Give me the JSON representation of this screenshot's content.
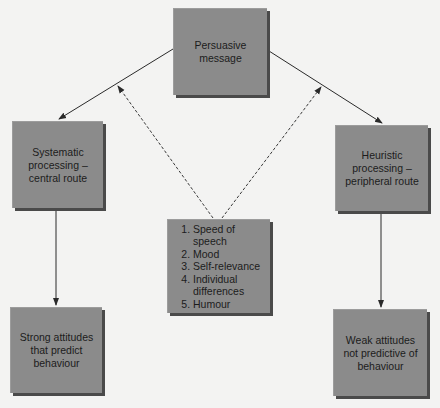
{
  "diagram": {
    "type": "flowchart",
    "colors": {
      "background": "#f3f3f2",
      "box_fill": "#8b8b8b",
      "box_shadow": "#4a4a4a",
      "line": "#2a2a2a",
      "text": "#1c1c1c"
    },
    "nodes": {
      "persuasive": {
        "label": "Persuasive\nmessage"
      },
      "systematic": {
        "label": "Systematic\nprocessing –\ncentral route"
      },
      "heuristic": {
        "label": "Heuristic\nprocessing –\nperipheral route"
      },
      "factors": {
        "items": [
          "Speed of speech",
          "Mood",
          "Self-relevance",
          "Individual differences",
          "Humour"
        ]
      },
      "strong": {
        "label": "Strong attitudes\nthat predict\nbehaviour"
      },
      "weak": {
        "label": "Weak attitudes\nnot predictive of\nbehaviour"
      }
    },
    "edges": [
      {
        "from": "persuasive",
        "to": "systematic",
        "style": "solid"
      },
      {
        "from": "persuasive",
        "to": "heuristic",
        "style": "solid"
      },
      {
        "from": "systematic",
        "to": "strong",
        "style": "solid"
      },
      {
        "from": "heuristic",
        "to": "weak",
        "style": "solid"
      },
      {
        "from": "factors",
        "to": "persuasive-systematic-edge",
        "style": "dashed"
      },
      {
        "from": "factors",
        "to": "persuasive-heuristic-edge",
        "style": "dashed"
      }
    ]
  }
}
